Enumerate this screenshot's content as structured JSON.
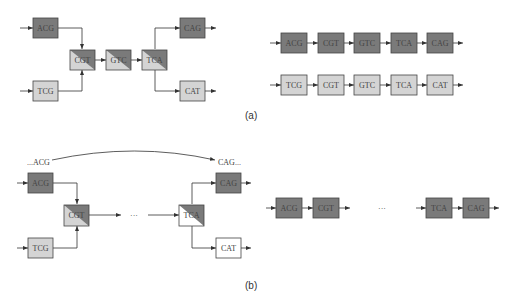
{
  "colors": {
    "dark": "#7a7a7a",
    "light": "#d4d4d4",
    "white": "#ffffff",
    "stroke": "#444444",
    "line": "#333333"
  },
  "panel_a": {
    "caption": "(a)",
    "graph": {
      "nodes": [
        {
          "id": "ACG",
          "label": "ACG",
          "fill": "dark"
        },
        {
          "id": "TCG",
          "label": "TCG",
          "fill": "light"
        },
        {
          "id": "CGT",
          "label": "CGT",
          "fill": "split"
        },
        {
          "id": "GTC",
          "label": "GTC",
          "fill": "split"
        },
        {
          "id": "TCA",
          "label": "TCA",
          "fill": "split"
        },
        {
          "id": "CAG",
          "label": "CAG",
          "fill": "dark"
        },
        {
          "id": "CAT",
          "label": "CAT",
          "fill": "light"
        }
      ],
      "edges": [
        [
          "ACG",
          "CGT"
        ],
        [
          "TCG",
          "CGT"
        ],
        [
          "CGT",
          "GTC"
        ],
        [
          "GTC",
          "TCA"
        ],
        [
          "TCA",
          "CAG"
        ],
        [
          "TCA",
          "CAT"
        ]
      ]
    },
    "chains": [
      {
        "labels": [
          "ACG",
          "CGT",
          "GTC",
          "TCA",
          "CAG"
        ],
        "fill": "dark"
      },
      {
        "labels": [
          "TCG",
          "CGT",
          "GTC",
          "TCA",
          "CAT"
        ],
        "fill": "light"
      }
    ]
  },
  "panel_b": {
    "caption": "(b)",
    "loop_start_label": "...ACG",
    "loop_end_label": "CAG...",
    "ellipsis": "···",
    "graph": {
      "nodes": [
        {
          "id": "ACG",
          "label": "ACG",
          "fill": "dark"
        },
        {
          "id": "TCG",
          "label": "TCG",
          "fill": "light"
        },
        {
          "id": "CGT",
          "label": "CGT",
          "fill": "split"
        },
        {
          "id": "TCA",
          "label": "TCA",
          "fill": "split-white"
        },
        {
          "id": "CAG",
          "label": "CAG",
          "fill": "dark"
        },
        {
          "id": "CAT",
          "label": "CAT",
          "fill": "white"
        }
      ]
    },
    "chain": {
      "labels": [
        "ACG",
        "CGT",
        "TCA",
        "CAG"
      ],
      "fill": "dark",
      "ellipsis": "···"
    }
  }
}
